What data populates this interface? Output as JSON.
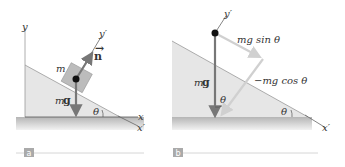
{
  "panel_a": {
    "tag": "a",
    "axis_y": "y",
    "axis_x": "x",
    "axis_y_prime": "y′",
    "axis_x_prime": "x′",
    "mass_label": "m",
    "normal_label": "n",
    "weight_label_m": "m",
    "weight_label_g": "g",
    "angle_label": "θ"
  },
  "panel_b": {
    "tag": "b",
    "axis_y_prime": "y′",
    "axis_x_prime": "x′",
    "weight_label_m": "m",
    "weight_label_g": "g",
    "component_parallel": "mg sin θ",
    "component_perp": "−mg cos θ",
    "angle_label_1": "θ",
    "angle_label_2": "θ"
  },
  "colors": {
    "incline": "#e4e4e4",
    "ground_top": "#b9b9b9",
    "ground_bottom": "#efefef",
    "block": "#b8b8b8",
    "arrow_dark": "#777777",
    "arrow_light": "#cfcfcf",
    "tag_bg": "#a9a9a9"
  }
}
